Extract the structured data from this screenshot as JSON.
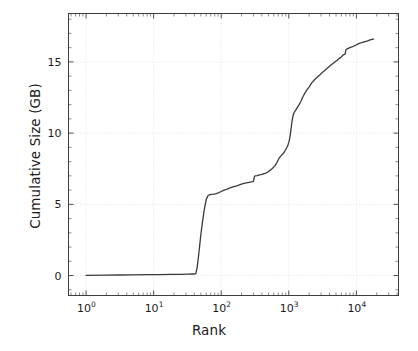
{
  "chart_data": {
    "type": "line",
    "title": "",
    "xlabel": "Rank",
    "ylabel": "Cumulative Size (GB)",
    "xscale": "log",
    "yscale": "linear",
    "xlim": [
      0.55,
      42000
    ],
    "ylim": [
      -1.4,
      18.4
    ],
    "grid": true,
    "grid_style": "dotted",
    "grid_color": "#d9d9d9",
    "legend": "none",
    "line_color": "#3a3a3a",
    "line_width": 1.3,
    "xticks": [
      {
        "value": 1,
        "label": "10",
        "exponent": "0"
      },
      {
        "value": 10,
        "label": "10",
        "exponent": "1"
      },
      {
        "value": 100,
        "label": "10",
        "exponent": "2"
      },
      {
        "value": 1000,
        "label": "10",
        "exponent": "3"
      },
      {
        "value": 10000,
        "label": "10",
        "exponent": "4"
      }
    ],
    "yticks": [
      {
        "value": 0,
        "label": "0"
      },
      {
        "value": 5,
        "label": "5"
      },
      {
        "value": 10,
        "label": "10"
      },
      {
        "value": 15,
        "label": "15"
      }
    ],
    "series": [
      {
        "name": "cumulative-size",
        "x": [
          1,
          2,
          3,
          5,
          8,
          12,
          18,
          25,
          32,
          38,
          42,
          44,
          46,
          48,
          50,
          53,
          56,
          60,
          64,
          68,
          72,
          78,
          85,
          92,
          100,
          110,
          120,
          135,
          150,
          170,
          190,
          210,
          235,
          260,
          290,
          300,
          310,
          320,
          340,
          360,
          380,
          400,
          430,
          460,
          500,
          540,
          580,
          620,
          670,
          720,
          780,
          840,
          900,
          960,
          1000,
          1030,
          1060,
          1090,
          1120,
          1160,
          1200,
          1260,
          1320,
          1400,
          1500,
          1600,
          1700,
          1800,
          1900,
          2000,
          2200,
          2400,
          2600,
          2900,
          3200,
          3600,
          4000,
          4400,
          4800,
          5200,
          5600,
          6000,
          6400,
          6800,
          7000,
          7200,
          7600,
          8000,
          8600,
          9200,
          10000,
          11000,
          12000,
          13000,
          14000,
          15000,
          16000,
          17000,
          18000
        ],
        "y": [
          0.02,
          0.03,
          0.04,
          0.05,
          0.06,
          0.07,
          0.08,
          0.09,
          0.1,
          0.11,
          0.12,
          0.55,
          1.3,
          2.1,
          2.9,
          3.8,
          4.6,
          5.35,
          5.62,
          5.68,
          5.7,
          5.72,
          5.76,
          5.82,
          5.9,
          6.0,
          6.05,
          6.15,
          6.22,
          6.3,
          6.38,
          6.45,
          6.5,
          6.55,
          6.6,
          6.62,
          6.95,
          7.0,
          7.02,
          7.05,
          7.08,
          7.1,
          7.15,
          7.2,
          7.3,
          7.42,
          7.55,
          7.7,
          7.95,
          8.25,
          8.45,
          8.6,
          8.85,
          9.1,
          9.35,
          9.6,
          10.0,
          10.45,
          10.9,
          11.25,
          11.45,
          11.6,
          11.75,
          11.95,
          12.2,
          12.5,
          12.75,
          12.95,
          13.1,
          13.25,
          13.55,
          13.75,
          13.9,
          14.1,
          14.3,
          14.5,
          14.7,
          14.85,
          15.0,
          15.12,
          15.25,
          15.35,
          15.5,
          15.55,
          15.85,
          15.9,
          15.95,
          16.0,
          16.05,
          16.12,
          16.2,
          16.3,
          16.35,
          16.4,
          16.45,
          16.5,
          16.55,
          16.58,
          16.6
        ]
      }
    ]
  }
}
